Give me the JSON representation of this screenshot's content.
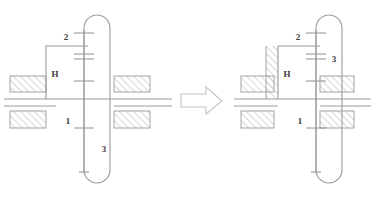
{
  "figure": {
    "type": "mechanical-schematic",
    "background_color": "#ffffff",
    "line_color": "#9a9a9a",
    "label_color": "#3a3a3a",
    "hatch_color": "#a9a9a9",
    "arrow_color": "#c3c3c3"
  },
  "left_diagram": {
    "name": "free-carrier-configuration",
    "labels": {
      "sun_gear": "1",
      "planet_gear": "2",
      "ring_gear": "3",
      "carrier": "H"
    },
    "carrier_fixed": false
  },
  "right_diagram": {
    "name": "fixed-carrier-configuration",
    "labels": {
      "sun_gear": "1",
      "planet_gear": "2",
      "ring_gear": "3",
      "carrier": "H"
    },
    "carrier_fixed": true
  },
  "arrow": {
    "name": "transformation-arrow",
    "direction": "right",
    "style": "hollow-outline"
  }
}
